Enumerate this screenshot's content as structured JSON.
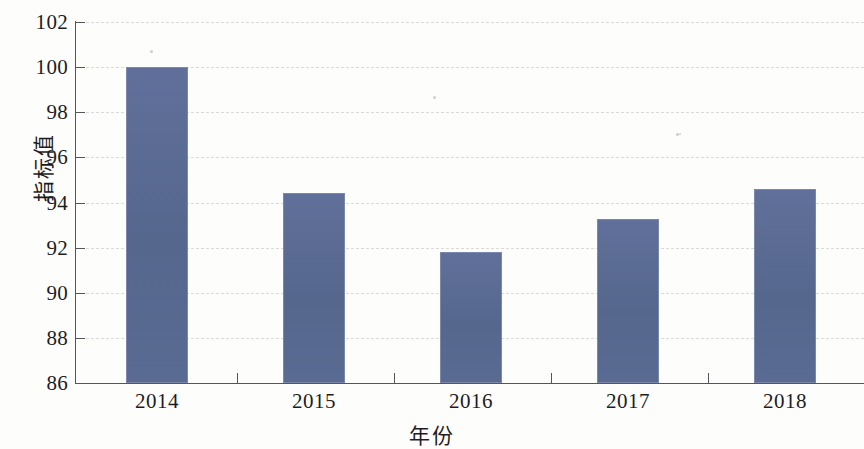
{
  "chart_data": {
    "type": "bar",
    "title": "",
    "subtitle": "",
    "xlabel": "年份",
    "ylabel": "指标值",
    "categories": [
      "2014",
      "2015",
      "2016",
      "2017",
      "2018"
    ],
    "values": [
      100.0,
      94.4,
      91.8,
      93.25,
      94.6
    ],
    "series": [
      {
        "name": "指标值",
        "values": [
          100.0,
          94.4,
          91.8,
          93.25,
          94.6
        ]
      }
    ],
    "ylim": [
      86,
      102
    ],
    "yticks": [
      86,
      88,
      90,
      92,
      94,
      96,
      98,
      100,
      102
    ],
    "ytick_labels": [
      "86",
      "88",
      "90",
      "92",
      "94",
      "96",
      "98",
      "100",
      "102"
    ],
    "grid": "horizontal-dashed",
    "legend": "none",
    "bar_color": "#5b6b92",
    "grid_color": "#d7d7d7",
    "axis_color": "#55555a",
    "background_color": "#fdfdfc"
  },
  "axes": {
    "y_title": "指标值",
    "x_title": "年份"
  }
}
